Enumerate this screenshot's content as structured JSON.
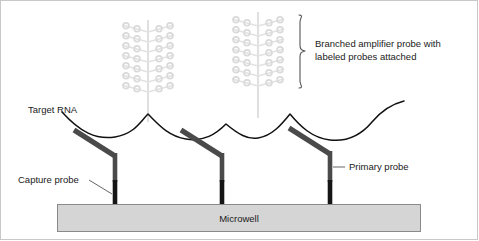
{
  "figure": {
    "background_color": "#ffffff"
  },
  "labels": {
    "target_rna": "Target RNA",
    "capture_probe": "Capture probe",
    "primary_probe": "Primary probe",
    "branched_line1": "Branched amplifier probe with",
    "branched_line2": "labeled probes attached",
    "microwell": "Microwell"
  },
  "colors": {
    "probe_bar": "#444444",
    "probe_foot": "#1a1a1a",
    "rna_curve": "#000000",
    "amplifier": "#e4e4e4",
    "amplifier_ring": "#dcdcdc",
    "microwell_fill": "#d5d5d5",
    "microwell_stroke": "#808080",
    "text": "#1a1a1a",
    "leader_line": "#555555"
  },
  "geometry": {
    "microwell": {
      "x": 57,
      "y": 204,
      "width": 364,
      "height": 28
    },
    "probe_positions_x": [
      115,
      222,
      330
    ],
    "amplifier_positions_x": [
      148,
      258
    ],
    "amplifier_branch_rows": 7,
    "rings_per_branch": 2,
    "bracket": {
      "x": 303,
      "y_top": 15,
      "y_bottom": 88
    }
  }
}
